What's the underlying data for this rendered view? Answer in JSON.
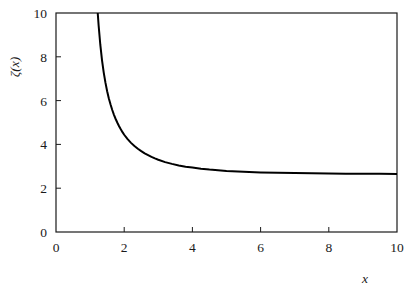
{
  "chart_data": {
    "type": "line",
    "title": "",
    "subtitle": "",
    "xlabel": "x",
    "ylabel": "ζ(x)",
    "xlim": [
      0,
      10
    ],
    "ylim": [
      0,
      10
    ],
    "grid": false,
    "legend": null,
    "annotations": [],
    "xticks": [
      0,
      2,
      4,
      6,
      8,
      10
    ],
    "xtick_labels": [
      "0",
      "2",
      "4",
      "6",
      "8",
      "10"
    ],
    "yticks": [
      0,
      2,
      4,
      6,
      8,
      10
    ],
    "ytick_labels": [
      "0",
      "2",
      "4",
      "6",
      "8",
      "10"
    ],
    "tick_direction": "in",
    "frame": true,
    "series": [
      {
        "name": "ζ(x)",
        "color": "#000000",
        "line_width": 2.0,
        "x": [
          1.2,
          1.22,
          1.25,
          1.3,
          1.35,
          1.4,
          1.45,
          1.5,
          1.55,
          1.6,
          1.65,
          1.7,
          1.75,
          1.8,
          1.85,
          1.9,
          1.95,
          2.0,
          2.1,
          2.2,
          2.3,
          2.4,
          2.5,
          2.6,
          2.7,
          2.8,
          2.9,
          3.0,
          3.2,
          3.4,
          3.6,
          3.8,
          4.0,
          4.25,
          4.5,
          4.75,
          5.0,
          5.5,
          6.0,
          6.5,
          7.0,
          7.5,
          8.0,
          8.5,
          9.0,
          9.5,
          10.0
        ],
        "y": [
          10.58,
          10.08,
          9.43,
          8.54,
          7.84,
          7.28,
          6.82,
          6.43,
          6.1,
          5.82,
          5.57,
          5.35,
          5.16,
          4.99,
          4.83,
          4.69,
          4.56,
          4.44,
          4.24,
          4.07,
          3.93,
          3.8,
          3.69,
          3.59,
          3.51,
          3.43,
          3.36,
          3.3,
          3.19,
          3.11,
          3.04,
          2.98,
          2.94,
          2.89,
          2.85,
          2.82,
          2.79,
          2.75,
          2.72,
          2.7,
          2.69,
          2.68,
          2.67,
          2.665,
          2.66,
          2.655,
          2.65
        ],
        "note": "Riemann zeta function; vertical asymptote (pole) at x = 1; horizontal asymptote y = 1 as x increases"
      }
    ]
  },
  "axes": {
    "x_axis_title": "x",
    "y_axis_title": "ζ(x)"
  }
}
